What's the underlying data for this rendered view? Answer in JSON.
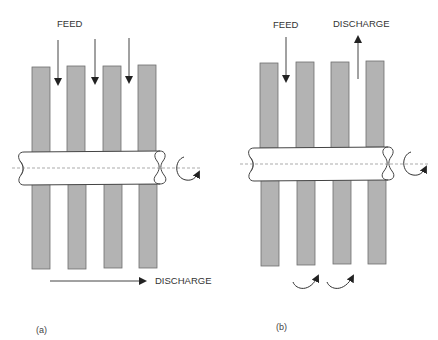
{
  "diagram_a": {
    "caption": "(a)",
    "feed_label": "FEED",
    "discharge_label": "DISCHARGE",
    "disc_count": 4,
    "feed_arrows": 3,
    "discharge_direction": "right",
    "shaft_rotation": "clockwise"
  },
  "diagram_b": {
    "caption": "(b)",
    "feed_label": "FEED",
    "discharge_label": "DISCHARGE",
    "disc_count": 4,
    "feed_arrows": 1,
    "discharge_direction": "up",
    "recirculation_arrows": 2,
    "shaft_rotation": "clockwise"
  },
  "colors": {
    "disc_fill": "#b3b3b3",
    "disc_stroke": "#6e6e6e",
    "shaft_fill": "#ffffff",
    "line": "#333333"
  }
}
